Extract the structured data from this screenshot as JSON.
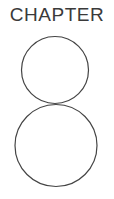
{
  "chapter": {
    "label": "CHAPTER",
    "number": "8",
    "text_color": "#3a3a3a",
    "stroke_color": "#444444"
  }
}
